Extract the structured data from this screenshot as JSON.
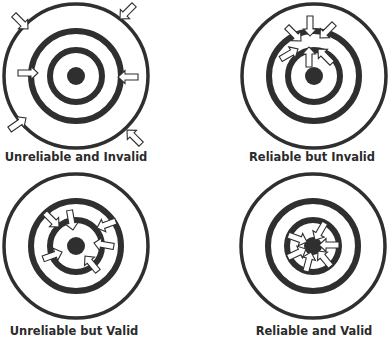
{
  "diagram": {
    "title": "",
    "colors": {
      "ring": "#2f2f2f",
      "arrow_fill": "#ffffff",
      "arrow_stroke": "#2f2f2f",
      "label": "#2b2b2b"
    },
    "targets": [
      {
        "id": "unreliable-invalid",
        "label": "Unreliable and Invalid",
        "cx": 76,
        "cy": 76,
        "label_x": 76,
        "label_y": 150
      },
      {
        "id": "reliable-invalid",
        "label": "Reliable but Invalid",
        "cx": 314,
        "cy": 76,
        "label_x": 312,
        "label_y": 150
      },
      {
        "id": "unreliable-valid",
        "label": "Unreliable but Valid",
        "cx": 76,
        "cy": 246,
        "label_x": 74,
        "label_y": 324
      },
      {
        "id": "reliable-valid",
        "label": "Reliable and Valid",
        "cx": 313,
        "cy": 246,
        "label_x": 314,
        "label_y": 324
      }
    ]
  }
}
